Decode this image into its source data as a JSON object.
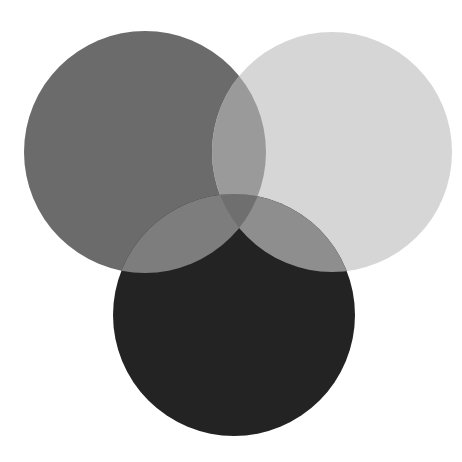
{
  "diagram": {
    "type": "venn",
    "background": "#ffffff",
    "width": 462,
    "height": 462,
    "circles": [
      {
        "id": "A",
        "position": "top-left",
        "cx": 145,
        "cy": 152,
        "r": 121,
        "color": "#6b6b6b"
      },
      {
        "id": "B",
        "position": "top-right",
        "cx": 332,
        "cy": 152,
        "r": 120,
        "color": "#d6d6d6"
      },
      {
        "id": "C",
        "position": "bottom",
        "cx": 234,
        "cy": 315,
        "r": 121,
        "color": "#232323"
      }
    ],
    "overlaps": {
      "AB": "#9a9a9a",
      "AC": "#7d7d7d",
      "BC": "#8e8e8e",
      "ABC": "#6f6f6f"
    }
  }
}
